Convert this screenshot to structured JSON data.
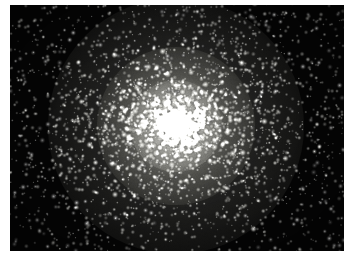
{
  "image": {
    "kind": "astronomical-photograph",
    "subject": "globular star cluster",
    "caption": "",
    "canvas": {
      "width": 352,
      "height": 261
    },
    "border": {
      "color": "#ffffff",
      "visible": true
    },
    "field": {
      "x": 10,
      "y": 5,
      "width": 334,
      "height": 246,
      "background_color": "#050505",
      "darkest_color": "#020202"
    },
    "cluster": {
      "center_x": 176,
      "center_y": 126,
      "core_color": "#f2f2ee",
      "halo_color": "#cfcfc8",
      "star_color": "#ffffff",
      "core_radius": 46,
      "halo_radius": 128,
      "star_count": 5200,
      "concentration": 2.1,
      "resolved": true
    },
    "grain": {
      "enabled": true,
      "opacity": 0.3,
      "color": "#9a9a92"
    },
    "vignette": {
      "enabled": true,
      "color": "#000000",
      "strength": 0.55
    }
  }
}
